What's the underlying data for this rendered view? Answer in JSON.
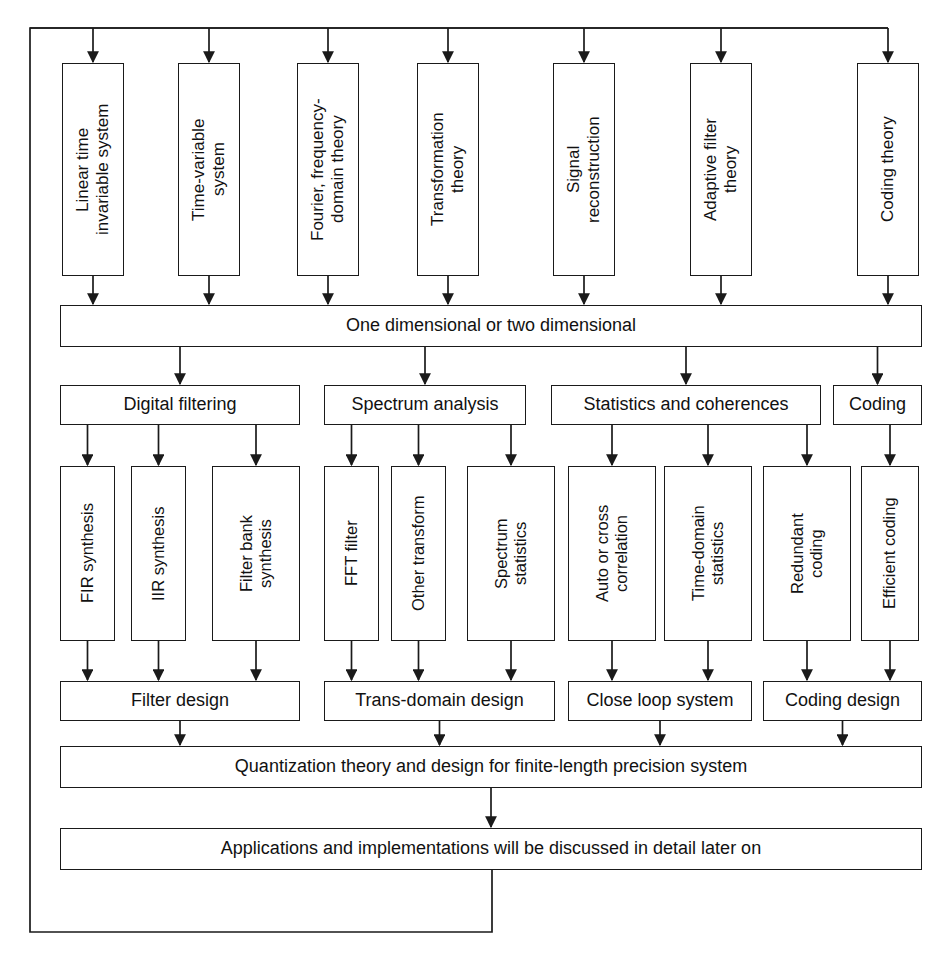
{
  "diagram": {
    "background_color": "#ffffff",
    "line_color": "#1a1a1a",
    "text_color": "#111111",
    "levels": {
      "theory_row_label": "Theory foundations",
      "dimension_label": "Dimensionality",
      "application_area_label": "Application areas",
      "method_label": "Methods",
      "design_label": "Designs",
      "summary_label": "Summary"
    },
    "level1": [
      {
        "id": "linear-time-invariable-system",
        "text": "Linear time\ninvariable system",
        "x": 62,
        "y": 63,
        "w": 62,
        "h": 213
      },
      {
        "id": "time-variable-system",
        "text": "Time-variable\nsystem",
        "x": 178,
        "y": 63,
        "w": 62,
        "h": 213
      },
      {
        "id": "fourier-frequency-domain-theory",
        "text": "Fourier, frequency-\ndomain theory",
        "x": 297,
        "y": 63,
        "w": 62,
        "h": 213
      },
      {
        "id": "transformation-theory",
        "text": "Transformation\ntheory",
        "x": 417,
        "y": 63,
        "w": 62,
        "h": 213
      },
      {
        "id": "signal-reconstruction",
        "text": "Signal\nreconstruction",
        "x": 553,
        "y": 63,
        "w": 62,
        "h": 213
      },
      {
        "id": "adaptive-filter-theory",
        "text": "Adaptive filter\ntheory",
        "x": 690,
        "y": 63,
        "w": 62,
        "h": 213
      },
      {
        "id": "coding-theory",
        "text": "Coding theory",
        "x": 857,
        "y": 63,
        "w": 62,
        "h": 213
      }
    ],
    "level2": [
      {
        "id": "one-or-two-dimensional",
        "text": "One dimensional or two dimensional",
        "x": 60,
        "y": 305,
        "w": 862,
        "h": 42
      }
    ],
    "level3": [
      {
        "id": "digital-filtering",
        "text": "Digital filtering",
        "x": 60,
        "y": 385,
        "w": 240,
        "h": 40
      },
      {
        "id": "spectrum-analysis",
        "text": "Spectrum analysis",
        "x": 324,
        "y": 385,
        "w": 202,
        "h": 40
      },
      {
        "id": "statistics-and-coherences",
        "text": "Statistics and coherences",
        "x": 551,
        "y": 385,
        "w": 270,
        "h": 40
      },
      {
        "id": "coding",
        "text": "Coding",
        "x": 833,
        "y": 385,
        "w": 89,
        "h": 40
      }
    ],
    "level4": [
      {
        "id": "fir-synthesis",
        "text": "FIR synthesis",
        "x": 60,
        "y": 466,
        "w": 55,
        "h": 175
      },
      {
        "id": "iir-synthesis",
        "text": "IIR synthesis",
        "x": 131,
        "y": 466,
        "w": 55,
        "h": 175
      },
      {
        "id": "filter-bank-synthesis",
        "text": "Filter bank\nsynthesis",
        "x": 212,
        "y": 466,
        "w": 88,
        "h": 175
      },
      {
        "id": "fft-filter",
        "text": "FFT filter",
        "x": 324,
        "y": 466,
        "w": 55,
        "h": 175
      },
      {
        "id": "other-transform",
        "text": "Other transform",
        "x": 391,
        "y": 466,
        "w": 55,
        "h": 175
      },
      {
        "id": "spectrum-statistics",
        "text": "Spectrum\nstatistics",
        "x": 467,
        "y": 466,
        "w": 88,
        "h": 175
      },
      {
        "id": "auto-or-cross-correlation",
        "text": "Auto or cross\ncorrelation",
        "x": 568,
        "y": 466,
        "w": 88,
        "h": 175
      },
      {
        "id": "time-domain-statistics",
        "text": "Time-domain\nstatistics",
        "x": 664,
        "y": 466,
        "w": 88,
        "h": 175
      },
      {
        "id": "redundant-coding",
        "text": "Redundant\ncoding",
        "x": 763,
        "y": 466,
        "w": 88,
        "h": 175
      },
      {
        "id": "efficient-coding",
        "text": "Efficient coding",
        "x": 861,
        "y": 466,
        "w": 58,
        "h": 175
      }
    ],
    "level5": [
      {
        "id": "filter-design",
        "text": "Filter design",
        "x": 60,
        "y": 681,
        "w": 240,
        "h": 40
      },
      {
        "id": "trans-domain-design",
        "text": "Trans-domain design",
        "x": 324,
        "y": 681,
        "w": 231,
        "h": 40
      },
      {
        "id": "close-loop-system",
        "text": "Close loop system",
        "x": 568,
        "y": 681,
        "w": 184,
        "h": 40
      },
      {
        "id": "coding-design",
        "text": "Coding design",
        "x": 763,
        "y": 681,
        "w": 159,
        "h": 40
      }
    ],
    "level6": [
      {
        "id": "quantization-theory",
        "text": "Quantization theory and design for finite-length precision system",
        "x": 60,
        "y": 746,
        "w": 862,
        "h": 42
      }
    ],
    "level7": [
      {
        "id": "applications-and-implementations",
        "text": "Applications and implementations will be discussed in detail later on",
        "x": 60,
        "y": 828,
        "w": 862,
        "h": 42
      }
    ],
    "feedback_loop": {
      "id": "feedback-loop",
      "description": "Return path from Applications box back to top distribution bus",
      "from_x": 492,
      "from_y": 870,
      "bottom_y": 932,
      "left_x": 30,
      "top_y": 28,
      "right_x": 888
    },
    "top_bus": {
      "id": "top-distribution-bus",
      "y": 28,
      "x_start": 30,
      "x_end": 888
    }
  }
}
